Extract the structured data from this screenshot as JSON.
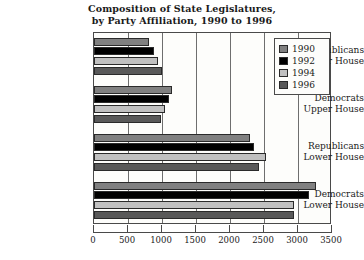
{
  "chart_data": {
    "type": "bar",
    "orientation": "horizontal",
    "title": "Composition of State Legislatures, by Party Affiliation, 1990 to 1996",
    "title_lines": [
      "Composition of State Legislatures,",
      "by Party Affiliation, 1990 to 1996"
    ],
    "xlabel": "",
    "ylabel": "",
    "xlim": [
      0,
      3500
    ],
    "xticks": [
      0,
      500,
      1000,
      1500,
      2000,
      2500,
      3000,
      3500
    ],
    "xtick_labels": [
      "0",
      "500",
      "1000",
      "1500",
      "2000",
      "2500",
      "3000",
      "3500"
    ],
    "grid": "vertical",
    "legend_position": "top-right",
    "categories": [
      "Republicans Upper House",
      "Democrats Upper House",
      "Republicans Lower House",
      "Democrats Lower House"
    ],
    "category_lines": [
      [
        "Republicans",
        "Upper House"
      ],
      [
        "Democrats",
        "Upper House"
      ],
      [
        "Republicans",
        "Lower House"
      ],
      [
        "Democrats",
        "Lower House"
      ]
    ],
    "series": [
      {
        "name": "1990",
        "color": "#808080",
        "values": [
          810,
          1140,
          2290,
          3260
        ]
      },
      {
        "name": "1992",
        "color": "#000000",
        "values": [
          880,
          1100,
          2360,
          3160
        ]
      },
      {
        "name": "1994",
        "color": "#c0c0c0",
        "values": [
          940,
          1050,
          2530,
          2940
        ]
      },
      {
        "name": "1996",
        "color": "#595959",
        "values": [
          1000,
          980,
          2420,
          2940
        ]
      }
    ]
  },
  "legend": {
    "items": [
      {
        "label": "1990",
        "color": "#808080"
      },
      {
        "label": "1992",
        "color": "#000000"
      },
      {
        "label": "1994",
        "color": "#c0c0c0"
      },
      {
        "label": "1996",
        "color": "#595959"
      }
    ]
  },
  "colors": {
    "background": "#ffffff",
    "plot_background": "#fdfdfb",
    "axis": "#4a4a4a",
    "gridline": "#6e6e6e",
    "text": "#1a1a1a"
  }
}
